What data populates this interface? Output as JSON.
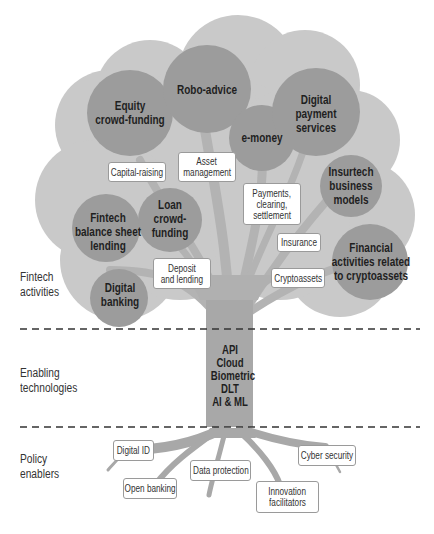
{
  "colors": {
    "canopy": "#c9c9c9",
    "circle": "#9c9c9c",
    "trunk": "#a5a5a5",
    "branch": "#b0b0b0",
    "dash": "#333333",
    "box_border": "#9a9a9a"
  },
  "layers": [
    {
      "label_line1": "Fintech",
      "label_line2": "activities"
    },
    {
      "label_line1": "Enabling",
      "label_line2": "technologies"
    },
    {
      "label_line1": "Policy",
      "label_line2": "enablers"
    }
  ],
  "fintech_activities": {
    "circles": [
      {
        "line1": "Equity",
        "line2": "crowd-funding"
      },
      {
        "line1": "Robo-advice"
      },
      {
        "line1": "e-money"
      },
      {
        "line1": "Digital",
        "line2": "payment",
        "line3": "services"
      },
      {
        "line1": "Insurtech",
        "line2": "business",
        "line3": "models"
      },
      {
        "line1": "Fintech",
        "line2": "balance sheet",
        "line3": "lending"
      },
      {
        "line1": "Loan",
        "line2": "crowd-",
        "line3": "funding"
      },
      {
        "line1": "Digital",
        "line2": "banking"
      },
      {
        "line1": "Financial",
        "line2": "activities related",
        "line3": "to cryptoassets"
      }
    ],
    "categories": [
      {
        "line1": "Capital-raising"
      },
      {
        "line1": "Asset",
        "line2": "management"
      },
      {
        "line1": "Payments,",
        "line2": "clearing,",
        "line3": "settlement"
      },
      {
        "line1": "Insurance"
      },
      {
        "line1": "Deposit",
        "line2": "and lending"
      },
      {
        "line1": "Cryptoassets"
      }
    ]
  },
  "enabling_technologies": [
    "API",
    "Cloud",
    "Biometric",
    "DLT",
    "AI & ML"
  ],
  "policy_enablers": [
    {
      "line1": "Digital ID"
    },
    {
      "line1": "Open banking"
    },
    {
      "line1": "Data protection"
    },
    {
      "line1": "Innovation",
      "line2": "facilitators"
    },
    {
      "line1": "Cyber security"
    }
  ]
}
